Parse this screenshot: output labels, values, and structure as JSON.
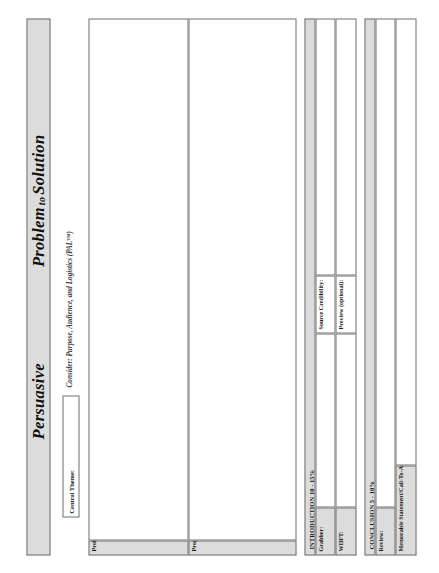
{
  "header": {
    "title_left": "Persuasive",
    "title_connector": "to",
    "title_right_a": "Problem",
    "title_right_b": "Solution",
    "title_full": "Persuasive   Problem to Solution"
  },
  "subtitle": "Consider: Purpose, Audience, and Logistics (PAL™)",
  "central_theme": {
    "label": "Central Theme:",
    "value": ""
  },
  "body": {
    "problem_definition_label": "Problem Definition:",
    "problem_definition_value": "",
    "proposed_solution_label": "Proposed Solution & Proof:",
    "proposed_solution_value": ""
  },
  "introduction": {
    "heading": "INTRODUCTION 10 - 15%",
    "fields": [
      {
        "label": "Grabber:",
        "value": ""
      },
      {
        "label": "Source Credibility:",
        "value": ""
      },
      {
        "label": "WIIFT:",
        "value": ""
      },
      {
        "label": "Preview (optional):",
        "value": ""
      }
    ]
  },
  "conclusion": {
    "heading": "CONCLUSION 5 - 10%",
    "fields": [
      {
        "label": "Review:",
        "value": ""
      },
      {
        "label": "Memorable Statement/Call-To-Action:",
        "value": ""
      }
    ]
  },
  "colors": {
    "shaded_fill": "#dcdcdc",
    "border": "#6e6e6e",
    "text": "#1a1a1a",
    "page": "#ffffff"
  }
}
